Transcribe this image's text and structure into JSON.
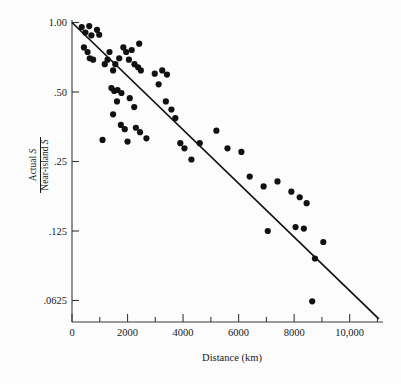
{
  "chart_data": {
    "type": "scatter",
    "title": "",
    "xlabel": "Distance (km)",
    "ylabel_numerator": "Actual S",
    "ylabel_denominator": "Near-island S",
    "xlim": [
      0,
      11200
    ],
    "ylim": [
      0.05,
      1.0
    ],
    "yscale": "log2",
    "grid": false,
    "legend": "none",
    "x_ticks_major": [
      0,
      2000,
      4000,
      6000,
      8000,
      10000
    ],
    "x_tick_labels": [
      "0",
      "2000",
      "4000",
      "6000",
      "8000",
      "10,000"
    ],
    "x_ticks_minor": [
      1000,
      3000,
      5000,
      7000,
      9000,
      11000
    ],
    "y_ticks": [
      1.0,
      0.5,
      0.25,
      0.125,
      0.0625
    ],
    "y_tick_labels": [
      "1.00",
      ".50",
      ".25",
      ".125",
      ".0625"
    ],
    "series": [
      {
        "name": "islands",
        "marker": "filled-circle",
        "color": "#111111",
        "points": [
          [
            350,
            0.955
          ],
          [
            480,
            0.905
          ],
          [
            620,
            0.965
          ],
          [
            700,
            0.88
          ],
          [
            430,
            0.78
          ],
          [
            560,
            0.745
          ],
          [
            900,
            0.93
          ],
          [
            980,
            0.885
          ],
          [
            760,
            0.69
          ],
          [
            640,
            0.7
          ],
          [
            1180,
            0.66
          ],
          [
            1280,
            0.69
          ],
          [
            1350,
            0.745
          ],
          [
            1480,
            0.62
          ],
          [
            1560,
            0.66
          ],
          [
            1700,
            0.7
          ],
          [
            1850,
            0.78
          ],
          [
            1950,
            0.745
          ],
          [
            2150,
            0.76
          ],
          [
            2420,
            0.81
          ],
          [
            2050,
            0.69
          ],
          [
            2250,
            0.66
          ],
          [
            2380,
            0.64
          ],
          [
            2480,
            0.62
          ],
          [
            1420,
            0.52
          ],
          [
            1520,
            0.505
          ],
          [
            1640,
            0.51
          ],
          [
            1780,
            0.495
          ],
          [
            1480,
            0.4
          ],
          [
            1620,
            0.455
          ],
          [
            2080,
            0.47
          ],
          [
            2240,
            0.43
          ],
          [
            1760,
            0.36
          ],
          [
            1900,
            0.345
          ],
          [
            2300,
            0.35
          ],
          [
            2450,
            0.335
          ],
          [
            1100,
            0.31
          ],
          [
            2000,
            0.305
          ],
          [
            2680,
            0.315
          ],
          [
            3120,
            0.54
          ],
          [
            2980,
            0.6
          ],
          [
            3250,
            0.62
          ],
          [
            3420,
            0.595
          ],
          [
            3580,
            0.42
          ],
          [
            3380,
            0.455
          ],
          [
            3720,
            0.385
          ],
          [
            3900,
            0.3
          ],
          [
            4050,
            0.285
          ],
          [
            4300,
            0.255
          ],
          [
            4600,
            0.3
          ],
          [
            5200,
            0.34
          ],
          [
            5600,
            0.285
          ],
          [
            6100,
            0.275
          ],
          [
            6400,
            0.215
          ],
          [
            6900,
            0.195
          ],
          [
            7050,
            0.125
          ],
          [
            7400,
            0.205
          ],
          [
            7900,
            0.185
          ],
          [
            8200,
            0.175
          ],
          [
            8450,
            0.165
          ],
          [
            8050,
            0.13
          ],
          [
            8350,
            0.128
          ],
          [
            8750,
            0.095
          ],
          [
            8650,
            0.062
          ],
          [
            9050,
            0.112
          ]
        ]
      }
    ],
    "fit_line": {
      "name": "regression-line",
      "x_start": 0,
      "y_start": 1.0,
      "x_end": 11050,
      "y_end": 0.052,
      "color": "#111111"
    }
  },
  "axes": {
    "x_axis_name": "distance-axis",
    "y_axis_name": "ratio-axis"
  }
}
